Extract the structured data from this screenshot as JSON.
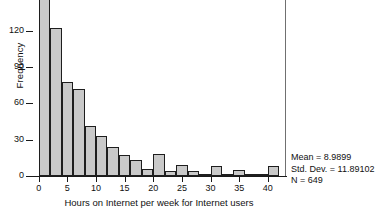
{
  "chart_data": {
    "type": "bar",
    "title": "",
    "xlabel": "Hours on Internet per week for Internet users",
    "ylabel": "Frequency",
    "grid": false,
    "legend": "none",
    "bin_width": 2,
    "xlim": [
      -1,
      43
    ],
    "ylim": [
      0,
      152
    ],
    "xticks": [
      0,
      5,
      10,
      15,
      20,
      25,
      30,
      35,
      40
    ],
    "xtick_labels": [
      "0",
      "5",
      "10",
      "15",
      "20",
      "25",
      "30",
      "35",
      "40"
    ],
    "yticks": [
      0,
      30,
      60,
      90,
      120,
      150
    ],
    "ytick_labels": [
      "0",
      "30",
      "60",
      "90",
      "120",
      "150"
    ],
    "note": "Top y tick label 150 is clipped by the top edge of the image; first bar extends past the top of the visible area.",
    "bins": [
      {
        "x_start": 0,
        "x_end": 2,
        "center": 1,
        "value": 152
      },
      {
        "x_start": 2,
        "x_end": 4,
        "center": 3,
        "value": 122
      },
      {
        "x_start": 4,
        "x_end": 6,
        "center": 5,
        "value": 78
      },
      {
        "x_start": 6,
        "x_end": 8,
        "center": 7,
        "value": 72
      },
      {
        "x_start": 8,
        "x_end": 10,
        "center": 9,
        "value": 41
      },
      {
        "x_start": 10,
        "x_end": 12,
        "center": 11,
        "value": 33
      },
      {
        "x_start": 12,
        "x_end": 14,
        "center": 13,
        "value": 24
      },
      {
        "x_start": 14,
        "x_end": 16,
        "center": 15,
        "value": 17
      },
      {
        "x_start": 16,
        "x_end": 18,
        "center": 17,
        "value": 13
      },
      {
        "x_start": 18,
        "x_end": 20,
        "center": 19,
        "value": 6
      },
      {
        "x_start": 20,
        "x_end": 22,
        "center": 21,
        "value": 18
      },
      {
        "x_start": 22,
        "x_end": 24,
        "center": 23,
        "value": 4
      },
      {
        "x_start": 24,
        "x_end": 26,
        "center": 25,
        "value": 9
      },
      {
        "x_start": 26,
        "x_end": 28,
        "center": 27,
        "value": 4
      },
      {
        "x_start": 28,
        "x_end": 30,
        "center": 29,
        "value": 1
      },
      {
        "x_start": 30,
        "x_end": 32,
        "center": 31,
        "value": 8
      },
      {
        "x_start": 32,
        "x_end": 34,
        "center": 33,
        "value": 1
      },
      {
        "x_start": 34,
        "x_end": 36,
        "center": 35,
        "value": 5
      },
      {
        "x_start": 36,
        "x_end": 38,
        "center": 37,
        "value": 1
      },
      {
        "x_start": 38,
        "x_end": 40,
        "center": 39,
        "value": 2
      },
      {
        "x_start": 40,
        "x_end": 42,
        "center": 41,
        "value": 8
      }
    ],
    "categories": [
      "1",
      "3",
      "5",
      "7",
      "9",
      "11",
      "13",
      "15",
      "17",
      "19",
      "21",
      "23",
      "25",
      "27",
      "29",
      "31",
      "33",
      "35",
      "37",
      "39",
      "41"
    ],
    "values": [
      152,
      122,
      78,
      72,
      41,
      33,
      24,
      17,
      13,
      6,
      18,
      4,
      9,
      4,
      1,
      8,
      1,
      5,
      1,
      2,
      8
    ],
    "colors": {
      "bar_fill": "#c9c9c9",
      "bar_edge": "#1e1e1e",
      "axis": "#1a1a1a",
      "frame": "#707070",
      "text": "#111111",
      "background": "#ffffff"
    }
  },
  "statistics": {
    "mean_label": "Mean = 8.9899",
    "std_dev_label": "Std. Dev. = 11.89102",
    "n_label": "N = 649",
    "mean": 8.9899,
    "std_dev": 11.89102,
    "n": 649
  }
}
